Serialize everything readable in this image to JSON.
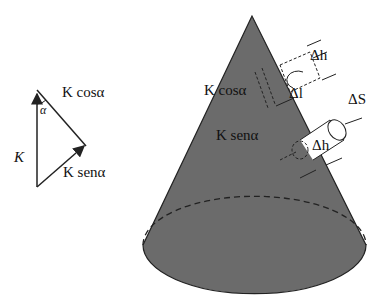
{
  "diagram": {
    "vector_triangle": {
      "labels": {
        "K": "K",
        "alpha": "α",
        "K_cos": "K cosα",
        "K_sen": "K senα"
      }
    },
    "cone": {
      "fill_color": "#6b6b6b",
      "labels": {
        "K_cos": "K cosα",
        "K_sen": "K senα",
        "delta_h_top": "Δh",
        "delta_l": "Δl",
        "delta_S": "ΔS",
        "delta_h_bottom": "Δh"
      }
    }
  }
}
